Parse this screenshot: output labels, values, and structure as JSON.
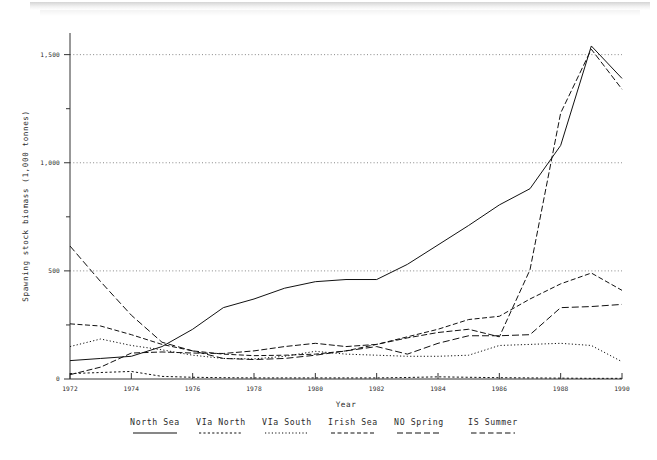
{
  "chart_data": {
    "type": "line",
    "title": "",
    "xlabel": "Year",
    "ylabel": "Spawning stock biomass (1,000 tonnes)",
    "xlim": [
      1972,
      1990
    ],
    "ylim": [
      0,
      1600
    ],
    "grid": true,
    "grid_values": [
      500,
      1000,
      1500
    ],
    "legend_position": "bottom",
    "x": [
      1972,
      1973,
      1974,
      1975,
      1976,
      1977,
      1978,
      1979,
      1980,
      1981,
      1982,
      1983,
      1984,
      1985,
      1986,
      1987,
      1988,
      1989,
      1990
    ],
    "xticks": [
      1972,
      1974,
      1976,
      1978,
      1980,
      1982,
      1984,
      1986,
      1988,
      1990
    ],
    "xticklabels": [
      "1972",
      "1974",
      "1976",
      "1978",
      "1980",
      "1982",
      "1984",
      "1986",
      "1988",
      "1990"
    ],
    "yticks": [
      0,
      500,
      1000,
      1500
    ],
    "yticklabels": [
      "0",
      "500",
      "1,000",
      "1,500"
    ],
    "yminorticks": [
      250,
      750,
      1250
    ],
    "series": [
      {
        "name": "North Sea",
        "style": "solid",
        "values": [
          85,
          95,
          105,
          150,
          230,
          330,
          370,
          420,
          450,
          460,
          460,
          530,
          620,
          710,
          805,
          880,
          1080,
          1540,
          1390
        ]
      },
      {
        "name": "VIa North",
        "style": "dashed-long",
        "values": [
          615,
          450,
          295,
          170,
          130,
          95,
          90,
          95,
          110,
          130,
          150,
          115,
          165,
          200,
          200,
          205,
          330,
          335,
          345
        ]
      },
      {
        "name": "VIa South",
        "style": "dotted",
        "values": [
          150,
          185,
          155,
          135,
          110,
          95,
          93,
          105,
          128,
          115,
          110,
          105,
          105,
          110,
          155,
          160,
          165,
          155,
          80
        ]
      },
      {
        "name": "Irish Sea",
        "style": "dashed-short",
        "values": [
          25,
          30,
          35,
          12,
          8,
          6,
          5,
          5,
          5,
          5,
          5,
          7,
          10,
          8,
          6,
          5,
          4,
          3,
          3
        ]
      },
      {
        "name": "NO Spring",
        "style": "dash-dot",
        "values": [
          20,
          55,
          120,
          125,
          120,
          118,
          130,
          150,
          165,
          150,
          160,
          190,
          215,
          230,
          195,
          505,
          1230,
          1525,
          1340
        ]
      },
      {
        "name": "IS Summer",
        "style": "dash-med",
        "values": [
          255,
          245,
          205,
          160,
          130,
          115,
          108,
          110,
          115,
          130,
          160,
          195,
          230,
          275,
          290,
          370,
          440,
          490,
          410
        ]
      }
    ]
  },
  "legend": {
    "items": [
      {
        "label": "North Sea",
        "style": "solid"
      },
      {
        "label": "VIa North",
        "style": "dashed-short"
      },
      {
        "label": "VIa South",
        "style": "dotted"
      },
      {
        "label": "Irish Sea",
        "style": "dashed-med"
      },
      {
        "label": "NO Spring",
        "style": "dash-long"
      },
      {
        "label": "IS Summer",
        "style": "dash-long2"
      }
    ]
  },
  "axes": {
    "x_title": "Year",
    "y_title": "Spawning stock biomass (1,000 tonnes)"
  }
}
